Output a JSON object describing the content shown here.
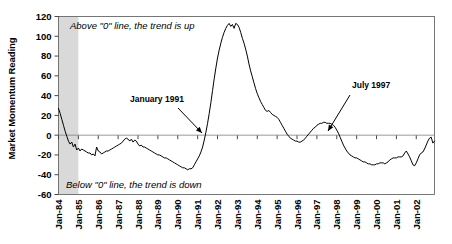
{
  "chart_data": {
    "type": "line",
    "title": "",
    "xlabel": "",
    "ylabel": "Market Momentum Reading",
    "ylim": [
      -60,
      120
    ],
    "yticks": [
      -60,
      -40,
      -20,
      0,
      20,
      40,
      60,
      80,
      100,
      120
    ],
    "ytick_labels": [
      "-60",
      "-40",
      "-20",
      "0",
      "20",
      "40",
      "60",
      "80",
      "100",
      "120"
    ],
    "xtick_labels": [
      "Jan-84",
      "Jan-85",
      "Jan-86",
      "Jan-87",
      "Jan-88",
      "Jan-89",
      "Jan-90",
      "Jan-91",
      "Jan-92",
      "Jan-93",
      "Jan-94",
      "Jan-95",
      "Jan-96",
      "Jan-97",
      "Jan-98",
      "Jan-99",
      "Jan-00",
      "Jan-01",
      "Jan-02"
    ],
    "grid": false,
    "legend": "none",
    "zero_line": 0,
    "series": [
      {
        "name": "Market Momentum",
        "color": "#000000",
        "x_start": "Jan-84",
        "x_step_months": 1,
        "values": [
          27,
          22,
          16,
          10,
          4,
          -1,
          -6,
          -9,
          -7,
          -12,
          -9,
          -15,
          -13,
          -16,
          -14,
          -15,
          -16,
          -17,
          -18,
          -18,
          -20,
          -19,
          -21,
          -12,
          -16,
          -17,
          -19,
          -18,
          -17,
          -16,
          -16,
          -15,
          -14,
          -13,
          -12,
          -11,
          -10,
          -9,
          -8,
          -6,
          -4,
          -3,
          -4,
          -6,
          -4,
          -7,
          -5,
          -6,
          -9,
          -11,
          -10,
          -12,
          -12,
          -13,
          -14,
          -15,
          -16,
          -17,
          -18,
          -19,
          -20,
          -20,
          -21,
          -22,
          -23,
          -23,
          -24,
          -25,
          -26,
          -27,
          -28,
          -29,
          -30,
          -31,
          -32,
          -33,
          -33,
          -34,
          -35,
          -34,
          -34,
          -33,
          -30,
          -27,
          -24,
          -21,
          -17,
          -12,
          -5,
          3,
          12,
          22,
          33,
          45,
          57,
          68,
          78,
          86,
          93,
          99,
          104,
          108,
          111,
          113,
          110,
          112,
          108,
          113,
          112,
          109,
          104,
          98,
          93,
          87,
          80,
          72,
          65,
          59,
          53,
          47,
          42,
          38,
          34,
          31,
          28,
          25,
          24,
          25,
          23,
          21,
          20,
          19,
          18,
          16,
          13,
          10,
          7,
          4,
          1,
          -1,
          -3,
          -4,
          -5,
          -6,
          -6,
          -7,
          -7,
          -6,
          -5,
          -3,
          -1,
          1,
          3,
          5,
          7,
          8,
          10,
          11,
          12,
          12,
          13,
          13,
          12,
          12,
          12,
          11,
          10,
          8,
          5,
          2,
          -2,
          -6,
          -10,
          -13,
          -16,
          -18,
          -20,
          -21,
          -22,
          -23,
          -23,
          -24,
          -25,
          -26,
          -27,
          -27,
          -28,
          -29,
          -29,
          -30,
          -30,
          -30,
          -29,
          -29,
          -28,
          -28,
          -28,
          -29,
          -28,
          -27,
          -25,
          -24,
          -23,
          -23,
          -23,
          -22,
          -22,
          -22,
          -21,
          -18,
          -16,
          -19,
          -22,
          -26,
          -30,
          -31,
          -28,
          -24,
          -20,
          -18,
          -17,
          -14,
          -10,
          -6,
          -3,
          -2,
          -8,
          -6
        ]
      }
    ],
    "shaded_band": {
      "from": "Jan-84",
      "to": "Jan-85",
      "color": "#d9d9d9"
    },
    "annotations": [
      {
        "label": "January 1991",
        "target_x": "Jan-91",
        "target_y": 0
      },
      {
        "label": "July 1997",
        "target_x": "Jul-97",
        "target_y": 0
      }
    ],
    "notes": [
      {
        "name": "above-zero-note",
        "text": "Above \"0\" line, the trend is up"
      },
      {
        "name": "below-zero-note",
        "text": "Below \"0\" line, the trend is down"
      }
    ]
  }
}
